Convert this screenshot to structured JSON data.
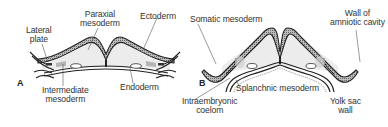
{
  "figure": {
    "panels": [
      {
        "id": "A",
        "labels": {
          "lateral_plate_1": "Lateral",
          "lateral_plate_2": "plate",
          "paraxial_1": "Paraxial",
          "paraxial_2": "mesoderm",
          "ectoderm": "Ectoderm",
          "intermediate_1": "Intermediate",
          "intermediate_2": "mesoderm",
          "endoderm": "Endoderm"
        }
      },
      {
        "id": "B",
        "labels": {
          "somatic": "Somatic mesoderm",
          "amnion_1": "Wall of",
          "amnion_2": "amniotic cavity",
          "splanchnic": "Splanchnic mesoderm",
          "coelom_1": "Intraembryonic",
          "coelom_2": "coelom",
          "yolk_1": "Yolk sac",
          "yolk_2": "wall"
        }
      }
    ],
    "colors": {
      "outline": "#222222",
      "stipple_fill": "#8a8a8a",
      "mesoderm_fill": "#e6e6e6",
      "leader_line": "#555555"
    }
  }
}
